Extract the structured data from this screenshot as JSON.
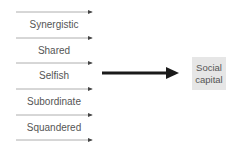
{
  "diagram": {
    "inputs": [
      {
        "label": "Synergistic"
      },
      {
        "label": "Shared"
      },
      {
        "label": "Selfish"
      },
      {
        "label": "Subordinate"
      },
      {
        "label": "Squandered"
      }
    ],
    "output": {
      "line1": "Social",
      "line2": "capital"
    },
    "colors": {
      "thin_arrow": "#888888",
      "thick_arrow": "#1a1a1a",
      "box": "#e6e6e6",
      "text": "#555555"
    }
  }
}
